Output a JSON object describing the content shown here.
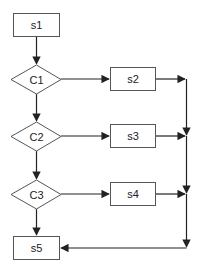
{
  "diagram": {
    "type": "flowchart",
    "colors": {
      "node_stroke": "#555555",
      "edge_stroke": "#222222",
      "background": "#ffffff",
      "text": "#222222"
    },
    "nodes": [
      {
        "id": "s1",
        "label": "s1",
        "shape": "rect"
      },
      {
        "id": "C1",
        "label": "C1",
        "shape": "diamond"
      },
      {
        "id": "s2",
        "label": "s2",
        "shape": "rect"
      },
      {
        "id": "C2",
        "label": "C2",
        "shape": "diamond"
      },
      {
        "id": "s3",
        "label": "s3",
        "shape": "rect"
      },
      {
        "id": "C3",
        "label": "C3",
        "shape": "diamond"
      },
      {
        "id": "s4",
        "label": "s4",
        "shape": "rect"
      },
      {
        "id": "s5",
        "label": "s5",
        "shape": "rect"
      }
    ],
    "edges": [
      {
        "from": "s1",
        "to": "C1"
      },
      {
        "from": "C1",
        "to": "s2"
      },
      {
        "from": "C1",
        "to": "C2"
      },
      {
        "from": "C2",
        "to": "s3"
      },
      {
        "from": "C2",
        "to": "C3"
      },
      {
        "from": "C3",
        "to": "s4"
      },
      {
        "from": "C3",
        "to": "s5"
      },
      {
        "from": "s2",
        "to": "s5",
        "via": "right-bus"
      },
      {
        "from": "s3",
        "to": "s5",
        "via": "right-bus"
      },
      {
        "from": "s4",
        "to": "s5",
        "via": "right-bus"
      }
    ]
  }
}
